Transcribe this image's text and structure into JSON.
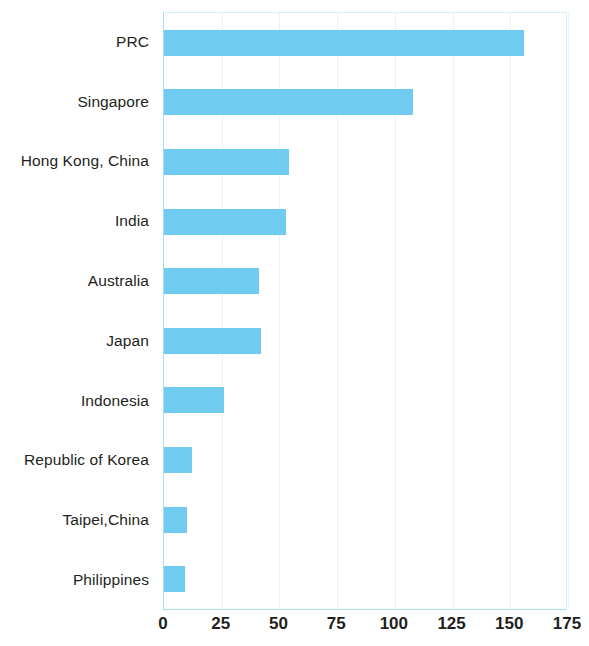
{
  "chart_data": {
    "type": "bar",
    "orientation": "horizontal",
    "title": "",
    "subtitle": "",
    "xlabel": "",
    "ylabel": "",
    "xlim": [
      0,
      175
    ],
    "xticks": [
      0,
      25,
      50,
      75,
      100,
      125,
      150,
      175
    ],
    "xtick_labels": [
      "0",
      "25",
      "50",
      "75",
      "100",
      "125",
      "150",
      "175"
    ],
    "grid": true,
    "grid_axis": "x",
    "legend": false,
    "bar_color": "#6fcbf0",
    "gridline_color": "#e3f3fb",
    "axis_color": "#aadcf0",
    "categories": [
      "PRC",
      "Singapore",
      "Hong Kong, China",
      "India",
      "Australia",
      "Japan",
      "Indonesia",
      "Republic of Korea",
      "Taipei,China",
      "Philippines"
    ],
    "values": [
      156,
      108,
      54,
      53,
      41,
      42,
      26,
      12,
      10,
      9
    ]
  }
}
